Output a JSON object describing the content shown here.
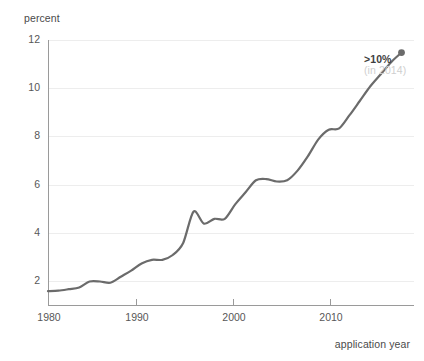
{
  "chart_data": {
    "type": "line",
    "title": "",
    "subtitle": "",
    "xlabel": "application year",
    "ylabel": "percent",
    "xlim": [
      1980,
      2015.2
    ],
    "ylim": [
      1.05,
      12.0
    ],
    "xticks": [
      1980,
      1990,
      2000,
      2010
    ],
    "xticklabels": [
      "1980",
      "1990",
      "2000",
      "2010"
    ],
    "yticks": [
      2,
      4,
      6,
      8,
      10,
      12
    ],
    "yticklabels": [
      "2",
      "4",
      "6",
      "8",
      "10",
      "12"
    ],
    "grid": "horizontal",
    "legend": "none",
    "line_color": "#6b6b6b",
    "line_width": 2.2,
    "marker_end_color": "#6b6b6b",
    "series": [
      {
        "name": "percent",
        "x": [
          1980,
          1981,
          1982,
          1983,
          1984,
          1985,
          1986,
          1987,
          1988,
          1989,
          1990,
          1991,
          1992,
          1993,
          1994,
          1995,
          1996,
          1997,
          1998,
          1999,
          2000,
          2001,
          2002,
          2003,
          2004,
          2005,
          2006,
          2007,
          2008,
          2009,
          2010,
          2011,
          2012,
          2013,
          2014
        ],
        "values": [
          1.6,
          1.62,
          1.68,
          1.75,
          2.0,
          2.0,
          1.95,
          2.2,
          2.45,
          2.75,
          2.9,
          2.9,
          3.1,
          3.6,
          4.9,
          4.4,
          4.6,
          4.6,
          5.2,
          5.7,
          6.2,
          6.25,
          6.15,
          6.2,
          6.6,
          7.2,
          7.9,
          8.3,
          8.35,
          8.9,
          9.5,
          10.1,
          10.6,
          11.1,
          11.5
        ]
      }
    ],
    "annotations": [
      {
        "name": "endpoint-callout",
        "text_primary": ">10%",
        "text_secondary": "(in 2014)",
        "at_x": 2014,
        "at_y": 11.5,
        "marker": "dot"
      }
    ]
  },
  "axis": {
    "ylabel": "percent",
    "xlabel": "application year",
    "yticks": [
      "12",
      "10",
      "8",
      "6",
      "4",
      "2"
    ],
    "xticks": [
      "1980",
      "1990",
      "2000",
      "2010"
    ]
  },
  "annotation": {
    "value_label": ">10%",
    "year_label": "(in 2014)"
  },
  "colors": {
    "line": "#6b6b6b",
    "gridline": "#ededed",
    "axis": "#9a9a9a",
    "tick_text": "#575757",
    "annot_value": "#3f3f3f",
    "annot_year": "#cfcfcf",
    "background": "#ffffff"
  }
}
